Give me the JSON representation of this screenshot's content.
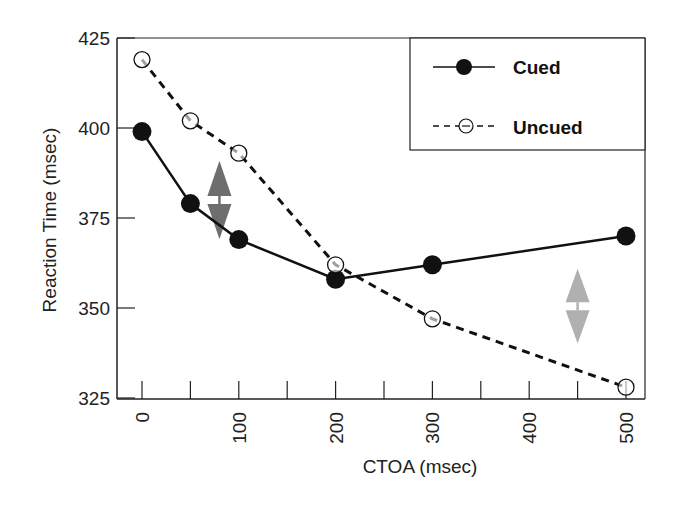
{
  "chart_data": {
    "type": "line",
    "title": "",
    "xlabel": "CTOA (msec)",
    "ylabel": "Reaction Time (msec)",
    "xlim": [
      -10,
      515
    ],
    "ylim": [
      325,
      425
    ],
    "x_ticks": [
      0,
      100,
      200,
      300,
      400,
      500
    ],
    "y_ticks": [
      325,
      350,
      375,
      400,
      425
    ],
    "grid": false,
    "legend_position": "upper right",
    "series": [
      {
        "name": "Cued",
        "style": "solid",
        "marker": "filled-circle",
        "x": [
          0,
          50,
          100,
          200,
          300,
          500
        ],
        "values": [
          399,
          379,
          369,
          358,
          362,
          370
        ]
      },
      {
        "name": "Uncued",
        "style": "dashed",
        "marker": "open-circle",
        "x": [
          0,
          50,
          100,
          200,
          300,
          500
        ],
        "values": [
          419,
          402,
          393,
          362,
          347,
          328
        ]
      }
    ],
    "annotations": [
      {
        "type": "double-arrow",
        "color": "#6e6e6e",
        "x": 80,
        "y_range": [
          373,
          387
        ],
        "meaning": "facilitation"
      },
      {
        "type": "double-arrow",
        "color": "#b0b0b0",
        "x": 450,
        "y_range": [
          344,
          357
        ],
        "meaning": "inhibition of return"
      }
    ]
  },
  "legend": {
    "cued": "Cued",
    "uncued": "Uncued"
  },
  "axes": {
    "x_title": "CTOA (msec)",
    "y_title": "Reaction Time (msec)",
    "x_tick_labels": [
      "0",
      "100",
      "200",
      "300",
      "400",
      "500"
    ],
    "y_tick_labels": [
      "425",
      "400",
      "375",
      "350",
      "325"
    ]
  }
}
